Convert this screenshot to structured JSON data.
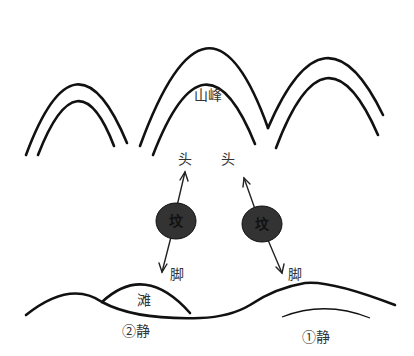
{
  "diagram": {
    "labels": {
      "peak": "山峰",
      "head_left": "头",
      "head_right": "头",
      "foot_left": "脚",
      "foot_right": "脚",
      "beach": "滩",
      "calm_2": "②静",
      "calm_1": "①静"
    },
    "tombs": [
      {
        "label": "坟",
        "fill": "#333333"
      },
      {
        "label": "坟",
        "fill": "#333333"
      }
    ],
    "colors": {
      "line": "#111111",
      "tomb_fill": "#333333",
      "text": "#333333"
    }
  }
}
